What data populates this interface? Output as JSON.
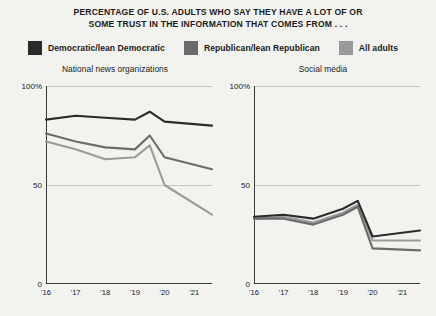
{
  "title": {
    "line1": "PERCENTAGE OF U.S. ADULTS WHO SAY THEY HAVE A LOT OF OR",
    "line2": "SOME TRUST IN THE INFORMATION THAT COMES FROM . . ."
  },
  "legend": {
    "items": [
      {
        "label": "Democratic/lean Democratic",
        "color": "#2b2b2b",
        "swatch_name": "legend-swatch-democratic"
      },
      {
        "label": "Republican/lean Republican",
        "color": "#6b6b6b",
        "swatch_name": "legend-swatch-republican"
      },
      {
        "label": "All adults",
        "color": "#9a9a9a",
        "swatch_name": "legend-swatch-all-adults"
      }
    ]
  },
  "axis": {
    "y_ticks": [
      "100%",
      "50",
      "0"
    ],
    "x_ticks": [
      "'16",
      "'17",
      "'18",
      "'19",
      "'20",
      "'21"
    ]
  },
  "chart_data": [
    {
      "type": "line",
      "title": "National news organizations",
      "xlabel": "",
      "ylabel": "",
      "ylim": [
        0,
        100
      ],
      "xlim": [
        2016,
        2021.6
      ],
      "grid": true,
      "gridlines": [
        50,
        100
      ],
      "legend_position": "top",
      "x": [
        2016,
        2017,
        2018,
        2019,
        2019.5,
        2020,
        2021.6
      ],
      "series": [
        {
          "name": "Democratic/lean Democratic",
          "color": "#2b2b2b",
          "values": [
            83,
            85,
            84,
            83,
            87,
            82,
            80
          ]
        },
        {
          "name": "Republican/lean Republican",
          "color": "#6b6b6b",
          "values": [
            76,
            72,
            69,
            68,
            75,
            64,
            58
          ]
        },
        {
          "name": "All adults",
          "color": "#9a9a9a",
          "values": [
            72,
            68,
            63,
            64,
            70,
            50,
            35
          ]
        }
      ]
    },
    {
      "type": "line",
      "title": "Social media",
      "xlabel": "",
      "ylabel": "",
      "ylim": [
        0,
        100
      ],
      "xlim": [
        2016,
        2021.6
      ],
      "grid": true,
      "gridlines": [
        50,
        100
      ],
      "legend_position": "top",
      "x": [
        2016,
        2017,
        2018,
        2019,
        2019.5,
        2020,
        2021.6
      ],
      "series": [
        {
          "name": "Democratic/lean Democratic",
          "color": "#2b2b2b",
          "values": [
            34,
            35,
            33,
            38,
            42,
            24,
            27
          ]
        },
        {
          "name": "Republican/lean Republican",
          "color": "#6b6b6b",
          "values": [
            33,
            33,
            30,
            35,
            39,
            18,
            17
          ]
        },
        {
          "name": "All adults",
          "color": "#9a9a9a",
          "values": [
            33,
            34,
            31,
            36,
            40,
            22,
            22
          ]
        }
      ]
    }
  ]
}
